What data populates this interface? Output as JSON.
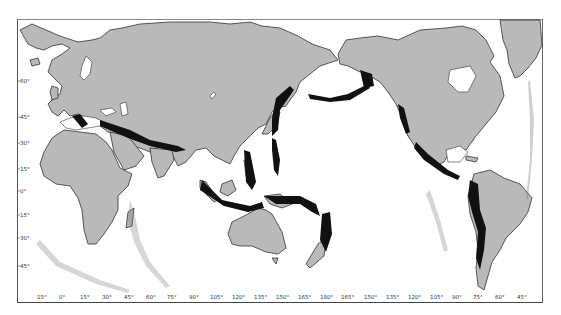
{
  "map": {
    "type": "world epicenter map",
    "projection_center": "Pacific (180° meridian at center)",
    "colors": {
      "land": "#b9b9b9",
      "ocean": "#ffffff",
      "coastline": "#333333",
      "epicenters": "#111111"
    },
    "x_axis_labels": [
      "15°",
      "0°",
      "15°",
      "30°",
      "45°",
      "60°",
      "75°",
      "90°",
      "105°",
      "120°",
      "135°",
      "150°",
      "165°",
      "180°",
      "165°",
      "150°",
      "135°",
      "120°",
      "105°",
      "90°",
      "75°",
      "60°",
      "45°"
    ],
    "y_axis_labels": [
      "60°",
      "45°",
      "30°",
      "15°",
      "0°",
      "15°",
      "30°",
      "45°"
    ]
  }
}
